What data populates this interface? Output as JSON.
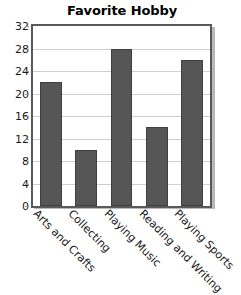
{
  "chart_data": {
    "type": "bar",
    "title": "Favorite Hobby",
    "xlabel": "",
    "ylabel": "",
    "categories": [
      "Arts and Crafts",
      "Collecting",
      "Playing Music",
      "Reading and Writing",
      "Playing Sports"
    ],
    "values": [
      22,
      10,
      28,
      14,
      26
    ],
    "ylim": [
      0,
      32
    ],
    "ytick_step": 4,
    "yticks": [
      "32",
      "28",
      "24",
      "20",
      "16",
      "12",
      "8",
      "4",
      "0"
    ],
    "grid": true,
    "legend": "none",
    "colors": {
      "bar_fill": "#565656",
      "bar_edge": "#3f3f3f",
      "grid": "#cfcfcf",
      "frame": "#595959",
      "plot_background": "#ffffff",
      "text": "#1a1a1a"
    }
  }
}
